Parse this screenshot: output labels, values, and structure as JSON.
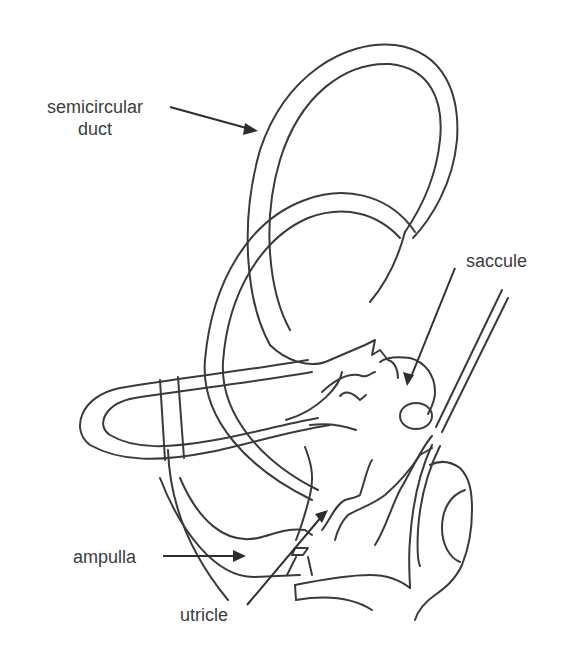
{
  "diagram": {
    "style": "black line drawing on white background",
    "colors": {
      "background": "#ffffff",
      "line": "#3a3a3a",
      "text": "#3c3c3c"
    },
    "labels": [
      {
        "id": "semicircular-duct",
        "line1": "semicircular",
        "line2": "duct",
        "arrow_target": "outer wall of upper semicircular duct loop"
      },
      {
        "id": "saccule",
        "text": "saccule",
        "arrow_target": "saccule (rounded sac right of utricle)"
      },
      {
        "id": "ampulla",
        "text": "ampulla",
        "arrow_target": "ampulla at base of posterior duct"
      },
      {
        "id": "utricle",
        "text": "utricle",
        "arrow_target": "utricle body (central)"
      }
    ]
  }
}
